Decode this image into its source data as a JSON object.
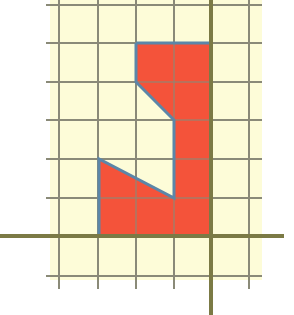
{
  "diagram": {
    "type": "grid-polygon",
    "colors": {
      "background": "#ffffff",
      "grid_paper": "#fdfcd8",
      "grid_line": "#8a8a78",
      "axis": "#7b7a45",
      "axis_highlight": "#c9c93a",
      "shape_fill": "#f4533a",
      "shape_stroke": "#5b86a8"
    },
    "grid": {
      "vertical_lines_x": [
        59,
        98,
        136,
        174,
        249
      ],
      "horizontal_lines_y": [
        5,
        43,
        82,
        120,
        159,
        198,
        276
      ],
      "paper": {
        "x": 50,
        "y": 0,
        "width": 212,
        "height": 280
      },
      "line_extent": {
        "x1": 46,
        "x2": 262,
        "y1": 0,
        "y2": 289
      }
    },
    "axes": {
      "x_axis_y": 236,
      "x_axis_from": 0,
      "x_axis_to": 284,
      "y_axis_x": 211,
      "y_axis_from": 0,
      "y_axis_to": 315
    },
    "shape": {
      "grid_units_vertices": [
        [
          -2,
          5
        ],
        [
          0,
          5
        ],
        [
          0,
          0
        ],
        [
          -3,
          0
        ],
        [
          -3,
          2
        ],
        [
          -1,
          1
        ],
        [
          -1,
          3
        ],
        [
          -2,
          4
        ]
      ],
      "pixel_points": "136,43 211,43 211,236 99,236 99,159 174,198 174,120 136,82"
    }
  }
}
